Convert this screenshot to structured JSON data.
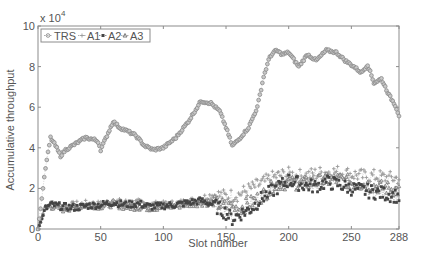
{
  "chart_data": {
    "type": "line",
    "title": "",
    "xlabel": "Slot number",
    "ylabel": "Accumulative throughput",
    "y_multiplier_label": "x 10",
    "y_multiplier_exponent": "4",
    "xlim": [
      0,
      288
    ],
    "ylim": [
      0,
      100000
    ],
    "x_ticks": [
      "0",
      "50",
      "100",
      "150",
      "200",
      "250",
      "288"
    ],
    "x_tick_values": [
      0,
      50,
      100,
      150,
      200,
      250,
      288
    ],
    "y_ticks": [
      "0",
      "2",
      "4",
      "6",
      "8",
      "10"
    ],
    "y_tick_values": [
      0,
      20000,
      40000,
      60000,
      80000,
      100000
    ],
    "grid": false,
    "legend_position": "top-left",
    "legend": [
      "TRS",
      "A1",
      "A2",
      "A3"
    ],
    "series": [
      {
        "name": "TRS",
        "marker": "circle",
        "color": "#8a8a8a",
        "x": [
          0,
          3,
          6,
          10,
          14,
          18,
          22,
          30,
          38,
          45,
          48,
          50,
          55,
          60,
          65,
          72,
          78,
          85,
          92,
          100,
          110,
          120,
          130,
          138,
          145,
          150,
          155,
          160,
          168,
          175,
          180,
          185,
          190,
          195,
          200,
          208,
          215,
          222,
          230,
          238,
          245,
          252,
          258,
          263,
          268,
          274,
          280,
          285,
          288
        ],
        "values": [
          0,
          15000,
          30000,
          45000,
          41000,
          36000,
          39000,
          42000,
          45000,
          44000,
          43000,
          39000,
          46000,
          53000,
          50000,
          48000,
          46000,
          41000,
          39000,
          40000,
          45000,
          53000,
          63000,
          62000,
          58000,
          50000,
          41000,
          44000,
          50000,
          60000,
          75000,
          85000,
          88000,
          86000,
          87000,
          80000,
          86000,
          83000,
          88000,
          87000,
          83000,
          80000,
          77000,
          81000,
          72000,
          74000,
          66000,
          61000,
          56000
        ]
      },
      {
        "name": "A1",
        "marker": "plus",
        "color": "#9a9a9a",
        "x": [
          0,
          3,
          6,
          10,
          20,
          30,
          40,
          50,
          60,
          70,
          80,
          90,
          100,
          110,
          120,
          130,
          140,
          150,
          160,
          170,
          180,
          190,
          200,
          210,
          220,
          230,
          240,
          250,
          260,
          270,
          280,
          288
        ],
        "values": [
          0,
          6000,
          11000,
          12000,
          11000,
          12000,
          12500,
          12000,
          13500,
          13000,
          13000,
          12000,
          12000,
          12500,
          13500,
          15000,
          17000,
          16000,
          17000,
          20000,
          23000,
          26000,
          27000,
          26000,
          27000,
          28000,
          28000,
          27000,
          26000,
          26000,
          25000,
          25000
        ]
      },
      {
        "name": "A2",
        "marker": "square",
        "color": "#444444",
        "x": [
          0,
          3,
          6,
          10,
          20,
          30,
          40,
          50,
          60,
          70,
          80,
          90,
          100,
          110,
          120,
          130,
          140,
          150,
          155,
          160,
          170,
          180,
          190,
          200,
          210,
          220,
          230,
          240,
          250,
          260,
          270,
          280,
          288
        ],
        "values": [
          0,
          5000,
          10000,
          12000,
          11000,
          10500,
          11500,
          12000,
          13000,
          12000,
          12500,
          11000,
          11500,
          12000,
          13000,
          14000,
          12000,
          8000,
          5000,
          7000,
          10000,
          16000,
          20000,
          24000,
          22000,
          21000,
          23000,
          22000,
          20000,
          19000,
          18000,
          17000,
          16000
        ]
      },
      {
        "name": "A3",
        "marker": "triangle",
        "color": "#6e6e6e",
        "x": [
          0,
          3,
          6,
          10,
          20,
          30,
          40,
          50,
          60,
          70,
          80,
          90,
          100,
          110,
          120,
          130,
          140,
          150,
          160,
          170,
          180,
          190,
          200,
          210,
          220,
          230,
          240,
          250,
          260,
          270,
          280,
          288
        ],
        "values": [
          0,
          5500,
          10500,
          11500,
          10000,
          11000,
          12000,
          11500,
          12500,
          11000,
          11000,
          10500,
          11000,
          11500,
          12500,
          13000,
          13000,
          11000,
          10000,
          13000,
          17000,
          22000,
          23000,
          22500,
          23000,
          24000,
          24500,
          23000,
          22000,
          21000,
          20000,
          19000
        ]
      }
    ]
  }
}
